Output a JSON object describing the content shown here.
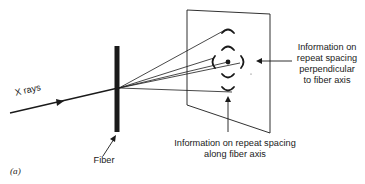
{
  "figure": {
    "panel_label": "(a)",
    "labels": {
      "xrays": "X rays",
      "fiber": "Fiber",
      "perpendicular_info": [
        "Information on",
        "repeat spacing",
        "perpendicular",
        "to fiber axis"
      ],
      "along_info": [
        "Information on repeat spacing",
        "along fiber axis"
      ]
    },
    "colors": {
      "ink": "#1a1a1a",
      "background": "#ffffff"
    }
  }
}
